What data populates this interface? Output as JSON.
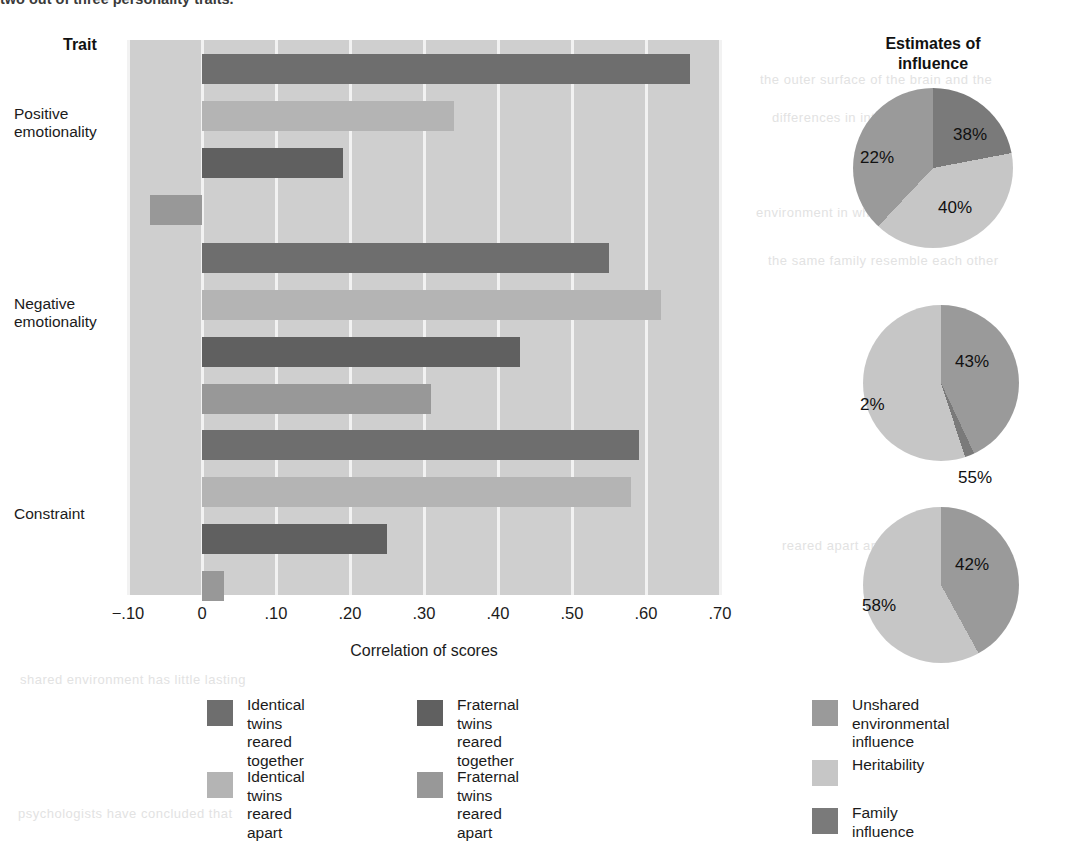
{
  "caption_clipped": "two out of three personality traits.",
  "bar_chart": {
    "trait_header": "Trait",
    "axis_title": "Correlation of scores",
    "xticks": [
      "−.10",
      "0",
      ".10",
      ".20",
      ".30",
      ".40",
      ".50",
      ".60",
      ".70"
    ],
    "traits": [
      "Positive\nemotionality",
      "Negative\nemotionality",
      "Constraint"
    ],
    "legend": [
      {
        "label": "Identical twins\nreared together",
        "color": "#6e6e6e"
      },
      {
        "label": "Identical twins\nreared apart",
        "color": "#b4b4b4"
      },
      {
        "label": "Fraternal twins\nreared together",
        "color": "#606060"
      },
      {
        "label": "Fraternal twins\nreared apart",
        "color": "#989898"
      }
    ]
  },
  "pies": {
    "header": "Estimates of\ninfluence",
    "legend": [
      {
        "label": "Unshared\nenvironmental influence",
        "color": "#9a9a9a"
      },
      {
        "label": "Heritability",
        "color": "#c6c6c6"
      },
      {
        "label": "Family influence",
        "color": "#7a7a7a"
      }
    ],
    "charts": [
      {
        "labels": [
          "22%",
          "40%",
          "38%"
        ]
      },
      {
        "labels": [
          "43%",
          "2%",
          "55%"
        ]
      },
      {
        "labels": [
          "42%",
          "58%"
        ]
      }
    ]
  },
  "ghost_rows": [
    "the outer surface of the brain and the",
    "differences in intelligence between",
    "environment in which the twins were",
    "the same family resemble each other",
    "reared apart are remarkably similar",
    "shared environment has little lasting",
    "psychologists have concluded that"
  ],
  "chart_data": {
    "type": "bar",
    "orientation": "horizontal",
    "title": "",
    "xlabel": "Correlation of scores",
    "ylabel": "Trait",
    "xlim": [
      -0.1,
      0.7
    ],
    "xticks": [
      -0.1,
      0,
      0.1,
      0.2,
      0.3,
      0.4,
      0.5,
      0.6,
      0.7
    ],
    "xticklabels": [
      "−.10",
      "0",
      ".10",
      ".20",
      ".30",
      ".40",
      ".50",
      ".60",
      ".70"
    ],
    "grid": true,
    "legend_position": "bottom-left",
    "categories": [
      "Positive emotionality",
      "Negative emotionality",
      "Constraint"
    ],
    "series": [
      {
        "name": "Identical twins reared together",
        "color": "#6e6e6e",
        "values": [
          0.66,
          0.55,
          0.59
        ]
      },
      {
        "name": "Identical twins reared apart",
        "color": "#b4b4b4",
        "values": [
          0.34,
          0.62,
          0.58
        ]
      },
      {
        "name": "Fraternal twins reared together",
        "color": "#606060",
        "values": [
          0.19,
          0.43,
          0.25
        ]
      },
      {
        "name": "Fraternal twins reared apart",
        "color": "#989898",
        "values": [
          -0.07,
          0.31,
          0.03
        ]
      }
    ],
    "companion_pies": {
      "type": "pie",
      "title": "Estimates of influence",
      "legend_position": "bottom-right",
      "slice_names": [
        "Unshared environmental influence",
        "Heritability",
        "Family influence"
      ],
      "slice_colors": [
        "#9a9a9a",
        "#c6c6c6",
        "#7a7a7a"
      ],
      "charts": [
        {
          "category": "Positive emotionality",
          "values": [
            38,
            40,
            22
          ],
          "labels": [
            "38%",
            "40%",
            "22%"
          ]
        },
        {
          "category": "Negative emotionality",
          "values": [
            43,
            55,
            2
          ],
          "labels": [
            "43%",
            "55%",
            "2%"
          ]
        },
        {
          "category": "Constraint",
          "values": [
            42,
            58,
            0
          ],
          "labels": [
            "42%",
            "58%"
          ]
        }
      ]
    }
  }
}
